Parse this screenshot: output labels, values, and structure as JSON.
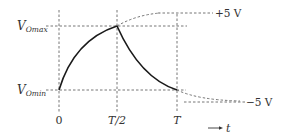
{
  "diagram": {
    "y_labels": {
      "vomax": {
        "main": "V",
        "sub": "Omax"
      },
      "vomin": {
        "main": "V",
        "sub": "Omin"
      }
    },
    "x_labels": {
      "zero": "0",
      "half_period": "T/2",
      "period": "T"
    },
    "asymptotes": {
      "upper": "+5 V",
      "lower": "−5 V"
    },
    "time_axis": {
      "arrow": "→",
      "label": "t"
    },
    "colors": {
      "curve": "#1a1a1a",
      "dashed": "#666666",
      "text": "#333333"
    }
  }
}
